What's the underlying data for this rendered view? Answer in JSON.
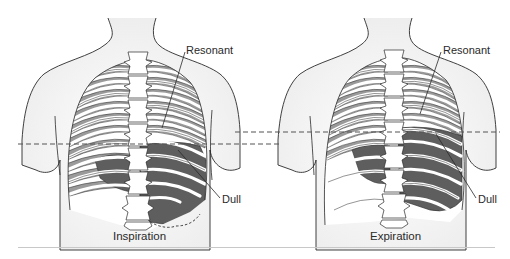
{
  "figure": {
    "panels": [
      {
        "id": "inspiration",
        "caption": "Inspiration",
        "labels": {
          "upper": "Resonant",
          "lower": "Dull"
        }
      },
      {
        "id": "expiration",
        "caption": "Expiration",
        "labels": {
          "upper": "Resonant",
          "lower": "Dull"
        }
      }
    ],
    "reference_lines": {
      "style": "dashed",
      "color": "#555555",
      "count": 2
    },
    "colors": {
      "resonant_lung": "#9a9a9a",
      "dull_region": "#5e5e5e",
      "rib": "#ffffff",
      "body_outline": "#2a2a2a",
      "skin_shading": "#efefef"
    }
  }
}
